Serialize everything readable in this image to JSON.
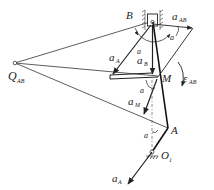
{
  "diagram": {
    "type": "mechanism acceleration diagram",
    "labels": {
      "B": "B",
      "a_AB": "a",
      "a_AB_sub": "AB",
      "Q_AB": "Q",
      "Q_AB_sub": "AB",
      "a_A_upper": "a",
      "a_A_upper_sub": "A",
      "a_B": "a",
      "a_B_sub": "B",
      "M": "M",
      "eps_AB": "ε",
      "eps_AB_sub": "AB",
      "a_M": "a",
      "a_M_sub": "M",
      "A": "A",
      "O1": "O",
      "O1_sub": "1",
      "a_A_lower": "a",
      "a_A_lower_sub": "A",
      "alpha_1": "a",
      "alpha_2": "a",
      "alpha_3": "a",
      "alpha_4": "a"
    },
    "points": {
      "B": [
        152,
        22
      ],
      "Q_AB": [
        15,
        63
      ],
      "M": [
        158,
        77
      ],
      "A": [
        168,
        128
      ],
      "O1": [
        152,
        152
      ]
    }
  }
}
